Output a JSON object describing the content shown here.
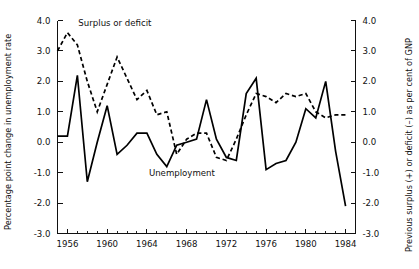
{
  "chart_data": {
    "type": "line",
    "title": "",
    "xlabel": "",
    "ylabel": "Percentage point change in unemployment rate",
    "y2label": "Previous surplus (+) or deficit (–) as per cent of GNP",
    "xlim": [
      1955,
      1985
    ],
    "ylim": [
      -3.0,
      4.0
    ],
    "y2lim": [
      -3.0,
      4.0
    ],
    "grid": false,
    "legend_position": "inline-annotations",
    "y_tick_labels": [
      "4.0",
      "3.0",
      "2.0",
      "1.0",
      "0.0",
      "-1.0",
      "-2.0",
      "-3.0"
    ],
    "y_tick_values": [
      4.0,
      3.0,
      2.0,
      1.0,
      0.0,
      -1.0,
      -2.0,
      -3.0
    ],
    "y2_tick_labels": [
      "4.0",
      "3.0",
      "2.0",
      "1.0",
      "0.0",
      "-1.0",
      "-2.0",
      "-3.0"
    ],
    "y2_tick_values": [
      4.0,
      3.0,
      2.0,
      1.0,
      0.0,
      -1.0,
      -2.0,
      -3.0
    ],
    "x_tick_labels": [
      "1956",
      "1960",
      "1964",
      "1968",
      "1972",
      "1976",
      "1980",
      "1984"
    ],
    "x_tick_values": [
      1956,
      1960,
      1964,
      1968,
      1972,
      1976,
      1980,
      1984
    ],
    "x_minor_step": 1,
    "y_axis_inverted": true,
    "annotations": [
      {
        "text": "Surplus or deficit",
        "x": 1957.1,
        "y": 3.82
      },
      {
        "text": "Unemployment",
        "x": 1964.2,
        "y": -1.12
      }
    ],
    "series": [
      {
        "name": "Unemployment",
        "style": "solid",
        "color": "#000000",
        "x": [
          1955,
          1956,
          1957,
          1958,
          1959,
          1960,
          1961,
          1962,
          1963,
          1964,
          1965,
          1966,
          1967,
          1968,
          1969,
          1970,
          1971,
          1972,
          1973,
          1974,
          1975,
          1976,
          1977,
          1978,
          1979,
          1980,
          1981,
          1982,
          1983,
          1984
        ],
        "values": [
          0.2,
          0.2,
          2.2,
          -1.3,
          0.0,
          1.2,
          -0.4,
          -0.1,
          0.3,
          0.3,
          -0.4,
          -0.8,
          -0.1,
          0.0,
          0.1,
          1.4,
          0.1,
          -0.5,
          -0.6,
          1.6,
          2.1,
          -0.9,
          -0.7,
          -0.6,
          0.0,
          1.1,
          0.8,
          2.0,
          -0.3,
          -2.1
        ]
      },
      {
        "name": "Surplus or deficit",
        "style": "dashed",
        "color": "#000000",
        "x": [
          1955,
          1956,
          1957,
          1958,
          1959,
          1960,
          1961,
          1962,
          1963,
          1964,
          1965,
          1966,
          1967,
          1968,
          1969,
          1970,
          1971,
          1972,
          1973,
          1974,
          1975,
          1976,
          1977,
          1978,
          1979,
          1980,
          1981,
          1982,
          1983,
          1984
        ],
        "values": [
          3.0,
          3.6,
          3.2,
          2.0,
          1.0,
          1.9,
          2.8,
          2.1,
          1.4,
          1.7,
          0.9,
          1.0,
          -0.4,
          0.1,
          0.3,
          0.3,
          -0.5,
          -0.6,
          0.1,
          0.9,
          1.6,
          1.5,
          1.3,
          1.6,
          1.5,
          1.6,
          1.0,
          0.8,
          0.9,
          0.9
        ]
      }
    ]
  },
  "axes": {
    "left_title": "Percentage point change in unemployment rate",
    "right_title": "Previous surplus (+) or deficit (–) as per cent of GNP"
  }
}
